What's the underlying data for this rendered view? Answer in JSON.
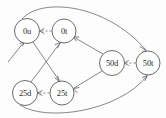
{
  "diagram": {
    "background_color": "#fdfdfd",
    "stroke_color": "#5a5a5a",
    "node_fill": "#ffffff",
    "nodes": [
      {
        "id": "0u",
        "label": "0u",
        "cx": 27,
        "cy": 31,
        "r": 12.5
      },
      {
        "id": "0t",
        "label": "0t",
        "cx": 64,
        "cy": 31,
        "r": 12.0
      },
      {
        "id": "25d",
        "label": "25d",
        "cx": 25,
        "cy": 93,
        "r": 12.5
      },
      {
        "id": "25t",
        "label": "25t",
        "cx": 62,
        "cy": 93,
        "r": 12.0
      },
      {
        "id": "50d",
        "label": "50d",
        "cx": 112,
        "cy": 63,
        "r": 12.5
      },
      {
        "id": "50t",
        "label": "50t",
        "cx": 148,
        "cy": 63,
        "r": 12.0
      }
    ],
    "edges": [
      {
        "from": "0t",
        "to": "0u",
        "style": "dashed"
      },
      {
        "from": "25t",
        "to": "25d",
        "style": "dashed"
      },
      {
        "from": "50t",
        "to": "50d",
        "style": "dashed"
      },
      {
        "from": "0u",
        "to": "25t",
        "style": "solid"
      },
      {
        "from": "25d",
        "to": "0t",
        "style": "solid"
      },
      {
        "from": "50d",
        "to": "0t",
        "style": "solid"
      },
      {
        "from": "50d",
        "to": "25t",
        "style": "solid"
      },
      {
        "from": "0u",
        "to": "50t",
        "style": "solid",
        "shape": "arc-top"
      },
      {
        "from": "25d",
        "to": "50t",
        "style": "solid",
        "shape": "arc-bottom"
      },
      {
        "from": "external",
        "to": "0u",
        "style": "solid",
        "shape": "entry-stub"
      }
    ]
  }
}
